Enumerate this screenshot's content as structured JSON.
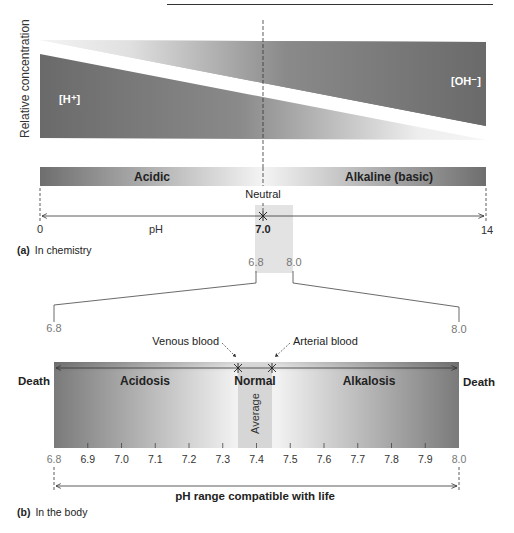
{
  "panel_a": {
    "y_axis_label": "Relative concentration",
    "h_label": "[H⁺]",
    "oh_label": "[OH⁻]",
    "acidic_label": "Acidic",
    "alkaline_label": "Alkaline (basic)",
    "neutral_label": "Neutral",
    "ph_min": "0",
    "ph_label": "pH",
    "ph_neutral": "7.0",
    "ph_max": "14",
    "caption_letter": "(a)",
    "caption_text": "In chemistry",
    "zoom_low": "6.8",
    "zoom_high": "8.0"
  },
  "panel_b": {
    "range_low": "6.8",
    "range_high": "8.0",
    "venous_label": "Venous blood",
    "arterial_label": "Arterial blood",
    "death_left": "Death",
    "death_right": "Death",
    "acidosis_label": "Acidosis",
    "normal_label": "Normal",
    "alkalosis_label": "Alkalosis",
    "average_label": "Average",
    "ticks": [
      "6.8",
      "6.9",
      "7.0",
      "7.1",
      "7.2",
      "7.3",
      "7.4",
      "7.5",
      "7.6",
      "7.7",
      "7.8",
      "7.9",
      "8.0"
    ],
    "life_range_label": "pH range compatible with life",
    "caption_letter": "(b)",
    "caption_text": "In the body"
  },
  "colors": {
    "dark_gray": "#6e6e6e",
    "light_gray": "#e6e6e6",
    "highlight": "#d9d9d9"
  }
}
